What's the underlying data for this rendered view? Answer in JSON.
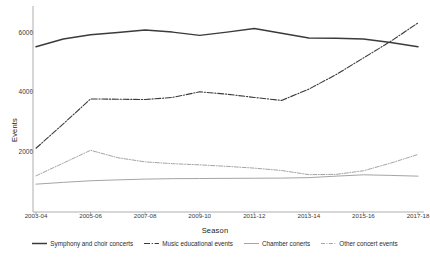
{
  "chart_data": {
    "type": "line",
    "title": "",
    "xlabel": "Season",
    "ylabel": "Events",
    "grid": false,
    "legend_position": "bottom",
    "xlim": [
      0,
      14
    ],
    "ylim": [
      0,
      6600
    ],
    "yticks": [
      2000,
      4000,
      6000
    ],
    "ytick_labels": [
      "2000",
      "4000",
      "6000"
    ],
    "x": [
      "2003-04",
      "2004-05",
      "2005-06",
      "2006-07",
      "2007-08",
      "2008-09",
      "2009-10",
      "2010-11",
      "2011-12",
      "2012-13",
      "2013-14",
      "2014-15",
      "2015-16",
      "2016-17",
      "2017-18"
    ],
    "xtick_labels": [
      "2003-04",
      "2005-06",
      "2007-08",
      "2009-10",
      "2011-12",
      "2013-14",
      "2015-16",
      "2017-18"
    ],
    "series": [
      {
        "name": "Symphony and choir concerts",
        "style": "solid",
        "color": "#3b3b3b",
        "width": 1.5,
        "values": [
          5500,
          5760,
          5900,
          5980,
          6060,
          5990,
          5880,
          5990,
          6110,
          5950,
          5790,
          5780,
          5760,
          5640,
          5500
        ]
      },
      {
        "name": "Music educational events",
        "style": "dash-dot",
        "color": "#3b3b3b",
        "width": 1.1,
        "values": [
          2080,
          2900,
          3740,
          3730,
          3720,
          3790,
          3980,
          3900,
          3790,
          3690,
          4070,
          4560,
          5120,
          5680,
          6300
        ]
      },
      {
        "name": "Chamber conerts",
        "style": "solid",
        "color": "#9a9a9a",
        "width": 0.9,
        "values": [
          870,
          930,
          985,
          1015,
          1040,
          1055,
          1060,
          1065,
          1070,
          1075,
          1090,
          1140,
          1185,
          1165,
          1140
        ]
      },
      {
        "name": "Other concert events",
        "style": "fine-dash-dot",
        "color": "#9a9a9a",
        "width": 0.9,
        "values": [
          1150,
          1580,
          2010,
          1760,
          1620,
          1560,
          1520,
          1470,
          1410,
          1330,
          1190,
          1200,
          1320,
          1580,
          1870
        ]
      }
    ]
  },
  "legend": {
    "items": [
      {
        "label": "Symphony and choir concerts"
      },
      {
        "label": "Music educational events"
      },
      {
        "label": "Chamber conerts"
      },
      {
        "label": "Other concert events"
      }
    ]
  }
}
